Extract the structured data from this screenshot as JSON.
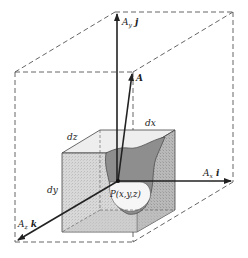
{
  "figure": {
    "labels": {
      "ay_j": "A",
      "ay_sub": "y",
      "ay_unit": "j",
      "a": "A",
      "ax_i": "A",
      "ax_sub": "x",
      "ax_unit": "i",
      "az_k": "A",
      "az_sub": "z",
      "az_unit": "k",
      "dx": "dx",
      "dy": "dy",
      "dz": "dz",
      "point": "P(x,y,z)"
    },
    "colors": {
      "line": "#222222",
      "dash": "#555555",
      "cube_face": "#d6d6d6",
      "cube_side": "#bdbdbd",
      "cavity": "#8c8c8c",
      "background": "#ffffff"
    }
  }
}
